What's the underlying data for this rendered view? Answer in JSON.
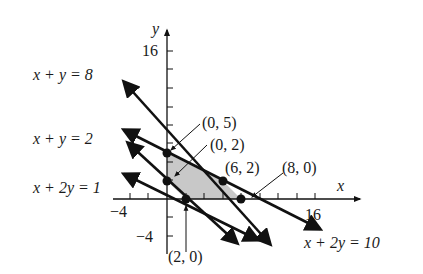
{
  "figure": {
    "type": "linear-programming-graph",
    "axes": {
      "x_label": "x",
      "y_label": "y",
      "x_tick_labels": {
        "neg": "−4",
        "pos": "16"
      },
      "y_tick_labels": {
        "pos": "16",
        "neg": "−4"
      },
      "tick_step": 2
    },
    "lines": [
      {
        "label": "x + y = 8"
      },
      {
        "label": "x + y = 2"
      },
      {
        "label": "x + 2y = 1"
      },
      {
        "label": "x + 2y = 10"
      }
    ],
    "points": [
      {
        "label": "(0, 5)"
      },
      {
        "label": "(0, 2)"
      },
      {
        "label": "(6, 2)"
      },
      {
        "label": "(8, 0)"
      },
      {
        "label": "(2, 0)"
      }
    ],
    "feasible_region_color": "#c8c8c8",
    "line_color": "#111111"
  }
}
